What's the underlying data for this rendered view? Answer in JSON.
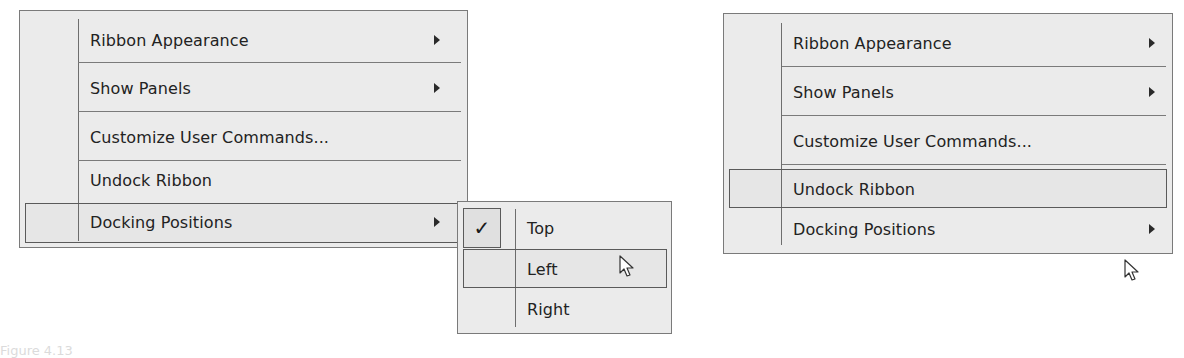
{
  "left_panel": {
    "menu": {
      "items": [
        {
          "label": "Ribbon Appearance",
          "has_submenu": true
        },
        {
          "label": "Show Panels",
          "has_submenu": true
        },
        {
          "label": "Customize User Commands...",
          "has_submenu": false
        },
        {
          "label": "Undock Ribbon",
          "has_submenu": false
        },
        {
          "label": "Docking Positions",
          "has_submenu": true,
          "highlighted": true
        }
      ]
    },
    "submenu": {
      "items": [
        {
          "label": "Top",
          "checked": true,
          "check_glyph": "✓"
        },
        {
          "label": "Left",
          "checked": false,
          "highlighted": true
        },
        {
          "label": "Right",
          "checked": false
        }
      ]
    }
  },
  "right_panel": {
    "menu": {
      "items": [
        {
          "label": "Ribbon Appearance",
          "has_submenu": true
        },
        {
          "label": "Show Panels",
          "has_submenu": true
        },
        {
          "label": "Customize User Commands...",
          "has_submenu": false
        },
        {
          "label": "Undock Ribbon",
          "has_submenu": false,
          "highlighted": true
        },
        {
          "label": "Docking Positions",
          "has_submenu": true
        }
      ]
    }
  },
  "caption": {
    "text": "Figure 4.13"
  }
}
